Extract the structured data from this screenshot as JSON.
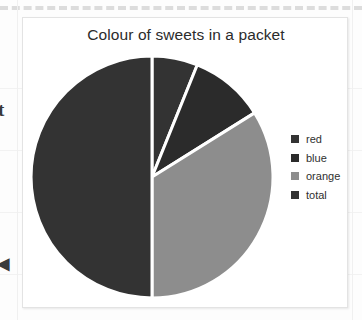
{
  "page": {
    "margin_letter": "t",
    "margin_arrow": "◀",
    "background_color": "#fdfdfd",
    "panel_border_color": "#e3e3e3",
    "dashed_rule_color": "#dcdcdc"
  },
  "chart_data": {
    "type": "pie",
    "title": "Colour of sweets in a packet",
    "xlabel": "",
    "ylabel": "",
    "grid": false,
    "legend_position": "right",
    "categories": [
      "red",
      "blue",
      "orange",
      "total"
    ],
    "values": [
      6,
      10,
      34,
      50
    ],
    "unit": "percent",
    "slice_angles_deg": [
      22,
      36,
      122,
      180
    ],
    "start_angle_deg": 0,
    "direction": "clockwise",
    "colors": [
      "#333333",
      "#2b2b2b",
      "#8d8d8d",
      "#333333"
    ],
    "slice_gap_color": "#ffffff",
    "series": [
      {
        "name": "Colour of sweets",
        "values": [
          6,
          10,
          34,
          50
        ]
      }
    ],
    "legend": [
      {
        "label": "red",
        "color": "#333333"
      },
      {
        "label": "blue",
        "color": "#2b2b2b"
      },
      {
        "label": "orange",
        "color": "#8d8d8d"
      },
      {
        "label": "total",
        "color": "#333333"
      }
    ]
  }
}
